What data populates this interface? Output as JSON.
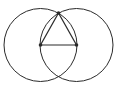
{
  "diagram": {
    "stroke_color": "#2a2a2a",
    "background": "#ffffff",
    "circles": [
      {
        "name": "left-circle",
        "cx": 40.5,
        "cy": 45,
        "r": 36.5
      },
      {
        "name": "right-circle",
        "cx": 76.5,
        "cy": 45,
        "r": 36.5
      }
    ],
    "points": [
      {
        "name": "point-a",
        "x": 40.5,
        "y": 45
      },
      {
        "name": "point-b",
        "x": 76.5,
        "y": 45
      },
      {
        "name": "point-c",
        "x": 58.5,
        "y": 13
      }
    ],
    "segments": [
      {
        "name": "segment-ab",
        "from": "point-a",
        "to": "point-b"
      },
      {
        "name": "segment-ac",
        "from": "point-a",
        "to": "point-c"
      },
      {
        "name": "segment-bc",
        "from": "point-b",
        "to": "point-c"
      }
    ]
  }
}
